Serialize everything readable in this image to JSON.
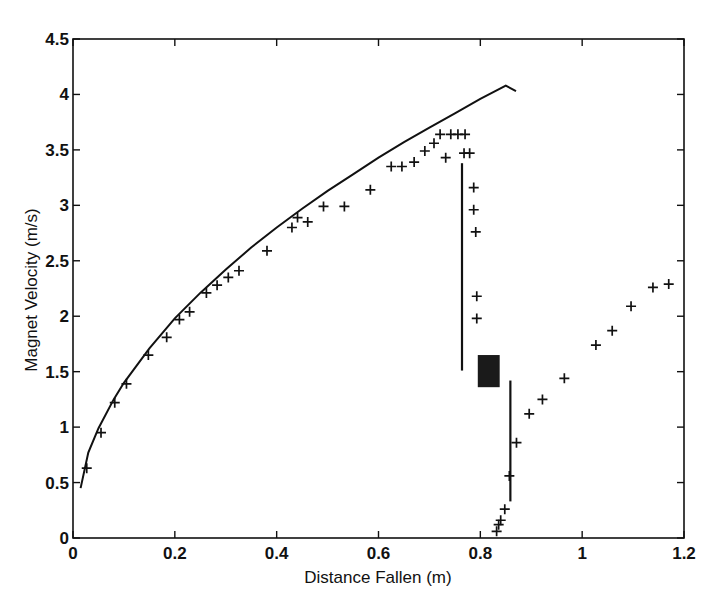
{
  "chart_data": {
    "type": "scatter",
    "title": "",
    "xlabel": "Distance Fallen (m)",
    "ylabel": "Magnet Velocity  (m/s)",
    "xlim": [
      0,
      1.2
    ],
    "ylim": [
      0,
      4.5
    ],
    "xticks": [
      0,
      0.2,
      0.4,
      0.6,
      0.8,
      1,
      1.2
    ],
    "xtick_labels": [
      "0",
      "0.2",
      "0.4",
      "0.6",
      "0.8",
      "1",
      "1.2"
    ],
    "yticks": [
      0,
      0.5,
      1,
      1.5,
      2,
      2.5,
      3,
      3.5,
      4,
      4.5
    ],
    "ytick_labels": [
      "0",
      "0.5",
      "1",
      "1.5",
      "2",
      "2.5",
      "3",
      "3.5",
      "4",
      "4.5"
    ],
    "grid": false,
    "legend": null,
    "series": [
      {
        "name": "free-fall curve",
        "style": "line",
        "x": [
          0.015,
          0.03,
          0.05,
          0.08,
          0.1,
          0.15,
          0.2,
          0.25,
          0.3,
          0.35,
          0.4,
          0.45,
          0.5,
          0.55,
          0.6,
          0.65,
          0.7,
          0.75,
          0.8,
          0.85,
          0.87
        ],
        "y": [
          0.45,
          0.77,
          0.99,
          1.25,
          1.4,
          1.71,
          1.98,
          2.21,
          2.42,
          2.62,
          2.8,
          2.97,
          3.13,
          3.28,
          3.43,
          3.57,
          3.7,
          3.83,
          3.96,
          4.08,
          4.03
        ]
      },
      {
        "name": "measured velocity (before obstruction)",
        "style": "plus-marker",
        "x": [
          0.027,
          0.055,
          0.082,
          0.105,
          0.148,
          0.184,
          0.209,
          0.229,
          0.262,
          0.283,
          0.305,
          0.326,
          0.381,
          0.43,
          0.441,
          0.461,
          0.492,
          0.533,
          0.584,
          0.625,
          0.646,
          0.67,
          0.691,
          0.709,
          0.721,
          0.732,
          0.742,
          0.756,
          0.77,
          0.768,
          0.779,
          0.787,
          0.787,
          0.791,
          0.793,
          0.793
        ],
        "y": [
          0.63,
          0.95,
          1.22,
          1.39,
          1.65,
          1.81,
          1.97,
          2.04,
          2.21,
          2.28,
          2.35,
          2.41,
          2.59,
          2.8,
          2.89,
          2.85,
          2.99,
          2.99,
          3.14,
          3.35,
          3.35,
          3.39,
          3.49,
          3.56,
          3.64,
          3.43,
          3.64,
          3.64,
          3.64,
          3.47,
          3.47,
          3.16,
          2.96,
          2.76,
          2.18,
          1.98
        ]
      },
      {
        "name": "measured velocity (after obstruction)",
        "style": "plus-marker",
        "x": [
          0.832,
          0.836,
          0.84,
          0.848,
          0.857,
          0.871,
          0.896,
          0.922,
          0.965,
          1.027,
          1.059,
          1.096,
          1.139,
          1.17
        ],
        "y": [
          0.06,
          0.12,
          0.16,
          0.26,
          0.56,
          0.86,
          1.12,
          1.25,
          1.44,
          1.74,
          1.87,
          2.09,
          2.26,
          2.29
        ]
      }
    ],
    "annotations": [
      {
        "type": "vertical-line",
        "x": 0.764,
        "y_from": 1.51,
        "y_to": 3.38
      },
      {
        "type": "vertical-line",
        "x": 0.859,
        "y_from": 0.33,
        "y_to": 1.42
      },
      {
        "type": "filled-rectangle",
        "x_from": 0.795,
        "x_to": 0.838,
        "y_from": 1.36,
        "y_to": 1.65,
        "color": "#1a1a1a"
      }
    ]
  },
  "colors": {
    "ink": "#111111",
    "background": "#ffffff",
    "block": "#1a1a1a"
  }
}
